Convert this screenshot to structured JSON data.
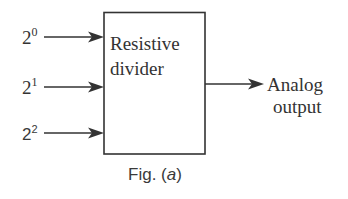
{
  "figure": {
    "caption": {
      "prefix": "Fig. (",
      "letter": "a",
      "suffix": ")"
    },
    "block": {
      "label_line1": "Resistive",
      "label_line2": "divider"
    },
    "inputs": [
      {
        "base": "2",
        "exponent": "0"
      },
      {
        "base": "2",
        "exponent": "1"
      },
      {
        "base": "2",
        "exponent": "2"
      }
    ],
    "output": {
      "label_line1": "Analog",
      "label_line2": "output"
    },
    "colors": {
      "line": "#333333",
      "text": "#333333",
      "background": "#ffffff"
    }
  }
}
